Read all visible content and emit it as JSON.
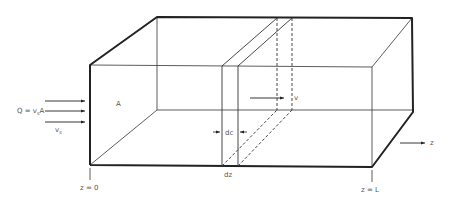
{
  "diagram": {
    "type": "3d-box-reactor",
    "labels": {
      "flow": "Q = v",
      "flow_sub": "s",
      "flow_tail": "A",
      "velocity": "v",
      "velocity_sub": "s",
      "area": "A",
      "slice_thickness": "dc",
      "slice_width": "dz",
      "inner_velocity": "v",
      "start": "z = 0",
      "end": "z = L",
      "axis": "z"
    },
    "colors": {
      "line": "#222222",
      "text": "#555555",
      "background": "#ffffff"
    }
  }
}
